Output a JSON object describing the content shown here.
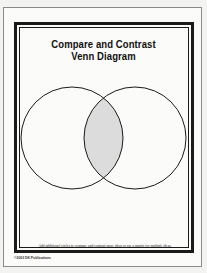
{
  "worksheet": {
    "title_line1": "Compare and Contrast",
    "title_line2": "Venn Diagram",
    "footnote": "Add additional circles to compare and contrast more ideas or use a matrix for multiple ideas.",
    "credit": "©2003 DK Publications"
  },
  "venn": {
    "circle_count": 2,
    "overlap_fill": "#dcdcdc",
    "stroke_color": "#1a1a1a",
    "circles": [
      {
        "cx": 72,
        "cy": 138,
        "r": 51
      },
      {
        "cx": 135,
        "cy": 138,
        "r": 51
      }
    ]
  }
}
